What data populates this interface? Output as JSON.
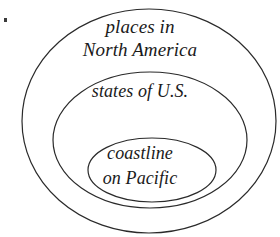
{
  "figure": {
    "type": "euler-diagram",
    "background_color": "#ffffff",
    "stroke_color": "#2a2a2a",
    "text_color": "#1a1a1a",
    "width": 280,
    "height": 237,
    "artifact": {
      "name": "corner-speck",
      "color": "#3b3b3b",
      "x": 4,
      "y": 18
    }
  },
  "sets": [
    {
      "id": "outer",
      "level": 1,
      "label_lines": [
        "places in",
        "North America"
      ],
      "label_full": "places in North America",
      "ellipse": {
        "cx": 149,
        "cy": 121,
        "rx": 127,
        "ry": 112
      },
      "stroke_color": "#2a2a2a",
      "stroke_width": 1.2,
      "fill": "none"
    },
    {
      "id": "middle",
      "level": 2,
      "label_lines": [
        "states of U.S."
      ],
      "label_full": "states of U.S.",
      "ellipse": {
        "cx": 150,
        "cy": 140,
        "rx": 97,
        "ry": 68
      },
      "stroke_color": "#2a2a2a",
      "stroke_width": 1.2,
      "fill": "none"
    },
    {
      "id": "inner",
      "level": 3,
      "label_lines": [
        "coastline",
        "on Pacific"
      ],
      "label_full": "coastline on Pacific",
      "ellipse": {
        "cx": 152,
        "cy": 170,
        "rx": 64,
        "ry": 32
      },
      "stroke_color": "#2a2a2a",
      "stroke_width": 1.2,
      "fill": "none"
    }
  ],
  "chart_data": {
    "type": "diagram",
    "subtype": "nested-euler",
    "title": "",
    "categories": [
      "places in North America",
      "states of U.S.",
      "coastline on Pacific"
    ],
    "nesting": "places in North America ⊃ states of U.S. ⊃ coastline on Pacific",
    "values": [
      3,
      2,
      1
    ],
    "legend": "none",
    "grid": false
  }
}
